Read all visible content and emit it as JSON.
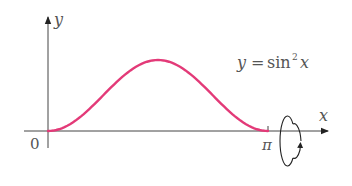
{
  "figure": {
    "equation": {
      "lhs": "y",
      "eq": "=",
      "func": "sin",
      "exponent": "2",
      "arg": "x"
    },
    "axes": {
      "x_label": "x",
      "y_label": "y",
      "origin_label": "0",
      "x_tick_label": "π"
    },
    "curve": {
      "function": "sin^2(x)",
      "domain": [
        0,
        3.14159
      ],
      "color": "#e33a78"
    },
    "rotation_indicator": "rotation about x-axis"
  },
  "chart_data": {
    "type": "line",
    "xlabel": "x",
    "ylabel": "y",
    "x": [
      0,
      0.3927,
      0.7854,
      1.1781,
      1.5708,
      1.9635,
      2.3562,
      2.7489,
      3.1416
    ],
    "series": [
      {
        "name": "y = sin² x",
        "values": [
          0,
          0.146,
          0.5,
          0.854,
          1,
          0.854,
          0.5,
          0.146,
          0
        ],
        "color": "#e33a78"
      }
    ],
    "x_ticks": [
      "0",
      "π"
    ],
    "xlim": [
      0,
      3.1416
    ],
    "ylim": [
      0,
      1
    ],
    "grid": false,
    "legend": "none"
  }
}
